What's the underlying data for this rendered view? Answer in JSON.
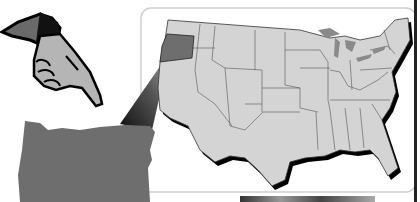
{
  "scene": {
    "description": "Clip-art illustration: pointing hand above enlarged Oregon, zoom beam to Oregon highlighted on US map inside rounded panel",
    "colors": {
      "background": "#ffffff",
      "map_fill": "#d4d4d4",
      "highlight_state": "#6e6e6e",
      "outline": "#000000",
      "panel_border": "#cfcfcf",
      "lakes": "#8a8a8a",
      "hand_skin": "#b5b5b5",
      "sleeve": "#6a6a6a"
    },
    "highlighted_state": "Oregon"
  }
}
